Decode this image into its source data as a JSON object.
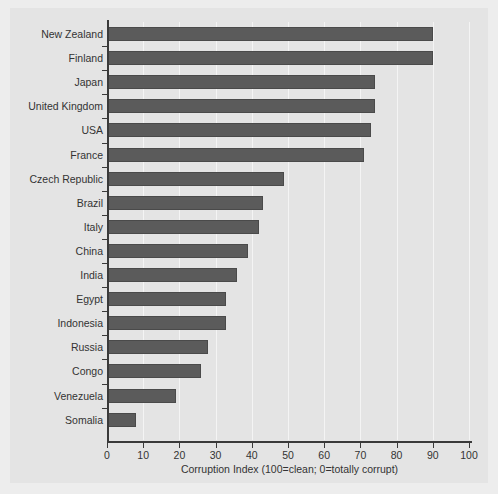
{
  "chart_data": {
    "type": "bar",
    "orientation": "horizontal",
    "title": "",
    "xlabel": "Corruption Index (100=clean; 0=totally corrupt)",
    "ylabel": "",
    "xlim": [
      0,
      100
    ],
    "xticks": [
      0,
      10,
      20,
      30,
      40,
      50,
      60,
      70,
      80,
      90,
      100
    ],
    "grid": "vertical-light",
    "legend": "none",
    "bar_color": "#5b5b5b",
    "panel_color": "#e4e4e4",
    "background_color": "#ededed",
    "categories": [
      "New Zealand",
      "Finland",
      "Japan",
      "United Kingdom",
      "USA",
      "France",
      "Czech Republic",
      "Brazil",
      "Italy",
      "China",
      "India",
      "Egypt",
      "Indonesia",
      "Russia",
      "Congo",
      "Venezuela",
      "Somalia"
    ],
    "values": [
      90,
      90,
      74,
      74,
      73,
      71,
      49,
      43,
      42,
      39,
      36,
      33,
      33,
      28,
      26,
      19,
      8
    ]
  }
}
